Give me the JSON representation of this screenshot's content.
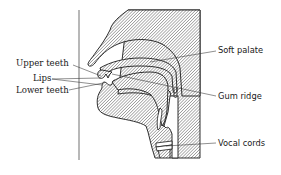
{
  "diagram": {
    "type": "anatomical cross-section",
    "labels_left": [
      {
        "id": "upper-teeth",
        "text": "Upper teeth"
      },
      {
        "id": "lips",
        "text": "Lips"
      },
      {
        "id": "lower-teeth",
        "text": "Lower teeth"
      }
    ],
    "labels_right": [
      {
        "id": "soft-palate",
        "text": "Soft palate"
      },
      {
        "id": "gum-ridge",
        "text": "Gum ridge"
      },
      {
        "id": "vocal-cords",
        "text": "Vocal cords"
      }
    ],
    "colors": {
      "line": "#1a1a1a",
      "hatch": "#555555",
      "background": "#ffffff"
    }
  }
}
